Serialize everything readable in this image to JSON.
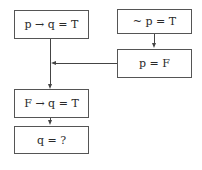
{
  "diagram": {
    "nodes": [
      {
        "id": "premise-conditional",
        "text": "p → q = T"
      },
      {
        "id": "premise-negation",
        "text": "~ p = T"
      },
      {
        "id": "derived-p",
        "text": "p = F"
      },
      {
        "id": "substituted",
        "text": "F → q = T"
      },
      {
        "id": "conclusion",
        "text": "q = ?"
      }
    ],
    "edges": [
      {
        "from": "premise-negation",
        "to": "derived-p"
      },
      {
        "from": "premise-conditional",
        "to": "substituted"
      },
      {
        "from": "derived-p",
        "to": "substituted"
      },
      {
        "from": "substituted",
        "to": "conclusion"
      }
    ]
  }
}
